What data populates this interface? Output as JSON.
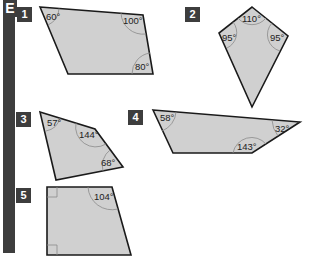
{
  "section_letter": "E",
  "problems": [
    {
      "number": "1",
      "angles": [
        "60°",
        "100°",
        "80°"
      ]
    },
    {
      "number": "2",
      "angles": [
        "110°",
        "95°",
        "95°"
      ]
    },
    {
      "number": "3",
      "angles": [
        "57°",
        "144°",
        "68°"
      ]
    },
    {
      "number": "4",
      "angles": [
        "58°",
        "32°",
        "143°"
      ]
    },
    {
      "number": "5",
      "angles": [
        "104°"
      ]
    }
  ],
  "colors": {
    "bar": "#3d3d3d",
    "shape_fill": "#d0d0d0",
    "outline": "#1a1a1a"
  }
}
